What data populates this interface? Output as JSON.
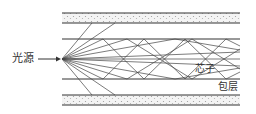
{
  "diagram": {
    "labels": {
      "source": "光源",
      "core": "芯子",
      "cladding": "包层"
    },
    "colors": {
      "line": "#333333",
      "cladding_fill": "#f2f2f2",
      "dots": "#999999"
    }
  }
}
